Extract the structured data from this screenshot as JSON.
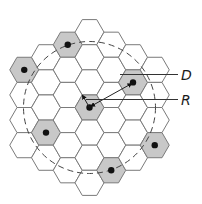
{
  "diagram": {
    "type": "hexagonal-cell-reuse",
    "grid": {
      "orientation": "flat-top",
      "cell_radius_px": 14.5,
      "center": [
        89.5,
        107.5
      ],
      "rings": 3
    },
    "colors": {
      "cell_fill": "#ffffff",
      "shaded_fill": "#c8c8c8",
      "cell_stroke": "#7a7a7a",
      "dot": "#111111",
      "line": "#333333"
    },
    "shaded_cells": [
      {
        "name": "center-cell",
        "q": 0,
        "r": 0
      },
      {
        "name": "cochannel-cell-top-right",
        "q": 2,
        "r": -2
      },
      {
        "name": "cochannel-cell-right",
        "q": 3,
        "r": 0
      },
      {
        "name": "cochannel-cell-bottom",
        "q": 1,
        "r": 2
      },
      {
        "name": "cochannel-cell-bottom-left",
        "q": -2,
        "r": 2
      },
      {
        "name": "cochannel-cell-left",
        "q": -3,
        "r": 0
      },
      {
        "name": "cochannel-cell-top-left",
        "q": -1,
        "r": -2
      }
    ],
    "labels": {
      "reuse_distance": "D",
      "cell_radius": "R"
    },
    "reuse_circle": {
      "style": "dashed",
      "radius_px": 66
    }
  }
}
